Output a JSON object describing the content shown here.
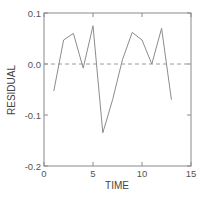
{
  "chart_data": {
    "type": "line",
    "title": "",
    "xlabel": "TIME",
    "ylabel": "RESIDUAL",
    "xlim": [
      0,
      15
    ],
    "ylim": [
      -0.2,
      0.1
    ],
    "xticks": [
      0,
      5,
      10,
      15
    ],
    "xtick_labels": [
      "0",
      "5",
      "10",
      "15"
    ],
    "yticks": [
      0.1,
      0.0,
      -0.1,
      -0.2
    ],
    "ytick_labels": [
      "0.1",
      "0.0",
      "-0.1",
      "-0.2"
    ],
    "grid": false,
    "reference_line": {
      "y": 0.0,
      "style": "dashed"
    },
    "series": [
      {
        "name": "residual",
        "x": [
          1,
          2,
          3,
          4,
          5,
          6,
          7,
          8,
          9,
          10,
          11,
          12,
          13
        ],
        "values": [
          -0.053,
          0.047,
          0.06,
          -0.008,
          0.075,
          -0.135,
          -0.07,
          0.008,
          0.062,
          0.047,
          0.0,
          0.07,
          -0.07
        ]
      }
    ]
  }
}
